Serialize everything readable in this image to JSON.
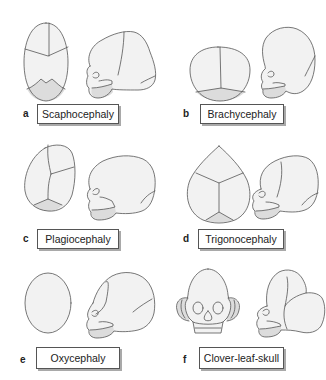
{
  "figure": {
    "panels": [
      {
        "letter": "a",
        "label": "Scaphocephaly"
      },
      {
        "letter": "b",
        "label": "Brachycephaly"
      },
      {
        "letter": "c",
        "label": "Plagiocephaly"
      },
      {
        "letter": "d",
        "label": "Trigonocephaly"
      },
      {
        "letter": "e",
        "label": "Oxycephaly"
      },
      {
        "letter": "f",
        "label": "Clover-leaf-skull"
      }
    ],
    "colors": {
      "skull_fill": "#f2f2f2",
      "shaded_region": "#dcdcdc",
      "outline": "#555555",
      "label_shadow": "#a9a9a9"
    }
  }
}
